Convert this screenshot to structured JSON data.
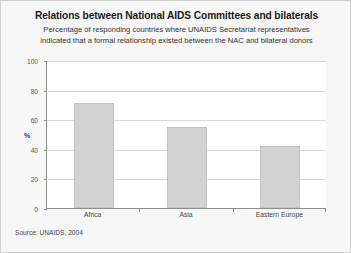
{
  "slide": {
    "title": "Relations between National AIDS Committees and bilaterals",
    "subtitle_line1": "Percentage of responding countries where UNAIDS Secretariat representatives",
    "subtitle_line2": "indicated that a formal relationship existed between the NAC and bilateral donors",
    "source": "Source: UNAIDS, 2004",
    "background_color": "#f7f7f7",
    "border_color": "#cfcfcf"
  },
  "chart_data": {
    "type": "bar",
    "title": "Relations between National AIDS Committees and bilaterals",
    "subtitle": "Percentage of responding countries where UNAIDS Secretariat representatives indicated that a formal relationship existed between the NAC and bilateral donors",
    "categories": [
      "Africa",
      "Asia",
      "Eastern Europe"
    ],
    "values": [
      71,
      55,
      42
    ],
    "xlabel": "",
    "ylabel": "%",
    "ylim": [
      0,
      100
    ],
    "yticks": [
      0,
      20,
      40,
      60,
      80,
      100
    ],
    "ytick_labels": [
      "0",
      "20",
      "40",
      "60",
      "80",
      "100"
    ],
    "grid": true,
    "legend": false,
    "bar_color": "#d2d2d2",
    "bar_border_color": "#c2c2c2",
    "plot_background": "#ffffff",
    "axis_color": "#8d8d8d",
    "gridline_color": "#d9d9d9"
  }
}
